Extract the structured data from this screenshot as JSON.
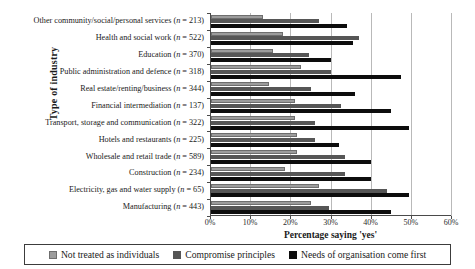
{
  "chart_data": {
    "type": "bar",
    "orientation": "horizontal",
    "title": "",
    "xlabel": "Percentage saying 'yes'",
    "ylabel": "Type of industry",
    "xlim": [
      0,
      60
    ],
    "xticks": [
      "0%",
      "10%",
      "20%",
      "30%",
      "40%",
      "50%",
      "60%"
    ],
    "grid": true,
    "legend_position": "bottom",
    "categories": [
      "Other community/social/personal services (n = 213)",
      "Health and social work (n = 522)",
      "Education (n = 370)",
      "Public administration and defence (n = 318)",
      "Real estate/renting/business (n = 344)",
      "Financial intermediation (n = 137)",
      "Transport, storage and communication (n = 322)",
      "Hotels and restaurants (n = 225)",
      "Wholesale and retail trade (n = 589)",
      "Construction (n = 234)",
      "Electricity, gas and water supply (n = 65)",
      "Manufacturing (n = 443)"
    ],
    "category_parts": [
      {
        "label": "Other community/social/personal services",
        "n": 213
      },
      {
        "label": "Health and social work",
        "n": 522
      },
      {
        "label": "Education",
        "n": 370
      },
      {
        "label": "Public administration and defence",
        "n": 318
      },
      {
        "label": "Real estate/renting/business",
        "n": 344
      },
      {
        "label": "Financial intermediation",
        "n": 137
      },
      {
        "label": "Transport, storage and communication",
        "n": 322
      },
      {
        "label": "Hotels and restaurants",
        "n": 225
      },
      {
        "label": "Wholesale and retail trade",
        "n": 589
      },
      {
        "label": "Construction",
        "n": 234
      },
      {
        "label": "Electricity, gas and water supply",
        "n": 65
      },
      {
        "label": "Manufacturing",
        "n": 443
      }
    ],
    "series": [
      {
        "name": "Not treated as individuals",
        "color": "#9c9c9c",
        "values": [
          13,
          18,
          15.5,
          22.5,
          14.5,
          21,
          21,
          21.5,
          21.5,
          18.5,
          27,
          25
        ]
      },
      {
        "name": "Compromise principles",
        "color": "#565656",
        "values": [
          27,
          37,
          24.5,
          30,
          25,
          32.5,
          26,
          26,
          33.5,
          33.5,
          44,
          29.5
        ]
      },
      {
        "name": "Needs of organisation come first",
        "color": "#0d0d0d",
        "values": [
          34,
          35.5,
          30,
          47.5,
          36,
          45,
          49.5,
          32,
          40,
          40,
          49.5,
          45
        ]
      }
    ]
  }
}
